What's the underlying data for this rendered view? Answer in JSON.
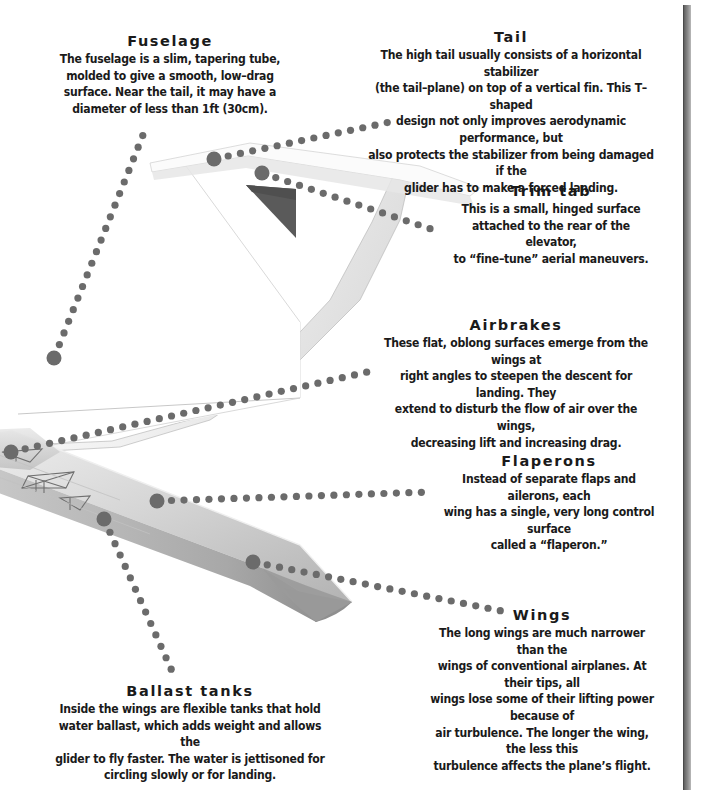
{
  "page": {
    "width": 703,
    "height": 790,
    "background": "#ffffff",
    "ink": "#1a1a1a",
    "leader_dot_color": "#6b6b6b",
    "gutter_color": "#6f6f6f"
  },
  "illustration": {
    "name": "cutaway-glider-sailplane",
    "fuselage_color": "#f4f4f4",
    "wing_color": "#cfcfcf",
    "wingtip_color": "#8f8f8f",
    "fin_shadow_color": "#5a5a5a",
    "outline_color": "#9a9a9a"
  },
  "callouts": [
    {
      "id": "fuselage",
      "title": "Fuselage",
      "body": "The fuselage is a slim, tapering tube,\nmolded to give a smooth, low–drag\nsurface. Near the tail, it may have a\ndiameter of less than 1ft (30cm).",
      "x": 48,
      "y": 32,
      "width": 244
    },
    {
      "id": "tail",
      "title": "Tail",
      "body": "The high tail usually consists of a horizontal stabilizer\n(the tail–plane) on top of a vertical fin. This T–shaped\ndesign not only improves aerodynamic performance, but\nalso protects the stabilizer from being damaged if the\nglider has to make a forced landing.",
      "x": 355,
      "y": 28,
      "width": 312
    },
    {
      "id": "trim-tab",
      "title": "Trim tab",
      "body": "This is a small, hinged surface\nattached to the rear of the elevator,\nto “fine–tune” aerial maneuvers.",
      "x": 437,
      "y": 182,
      "width": 228
    },
    {
      "id": "airbrakes",
      "title": "Airbrakes",
      "body": "These flat, oblong surfaces emerge from the wings at\nright angles to steepen the descent for landing. They\nextend to disturb the flow of air over the wings,\ndecreasing lift and increasing drag.",
      "x": 366,
      "y": 316,
      "width": 300
    },
    {
      "id": "flaperons",
      "title": "Flaperons",
      "body": "Instead of separate flaps and ailerons, each\nwing has a single, very long control surface\ncalled a “flaperon.”",
      "x": 432,
      "y": 452,
      "width": 234
    },
    {
      "id": "wings",
      "title": "Wings",
      "body": "The long wings are much narrower than the\nwings of conventional airplanes. At their tips, all\nwings lose some of their lifting power because of\nair turbulence. The longer the wing, the less this\nturbulence affects the plane’s flight.",
      "x": 418,
      "y": 606,
      "width": 248
    },
    {
      "id": "ballast-tanks",
      "title": "Ballast tanks",
      "body": "Inside the wings are flexible tanks that hold\nwater ballast, which adds weight and allows the\nglider to fly faster. The water is jettisoned for\ncircling slowly or for landing.",
      "x": 42,
      "y": 682,
      "width": 296
    }
  ],
  "leaders": [
    {
      "id": "leader-fuselage",
      "anchor": {
        "x": 54,
        "y": 358,
        "r": 7.5
      },
      "path": [
        [
          54,
          358
        ],
        [
          145,
          130
        ]
      ],
      "dot_r": 3.6,
      "spacing": 12.5
    },
    {
      "id": "leader-tail",
      "anchor": {
        "x": 214,
        "y": 159,
        "r": 7.5
      },
      "path": [
        [
          214,
          159
        ],
        [
          390,
          122
        ]
      ],
      "dot_r": 3.6,
      "spacing": 12.5
    },
    {
      "id": "leader-trim-tab",
      "anchor": {
        "x": 262,
        "y": 173,
        "r": 7.5
      },
      "path": [
        [
          262,
          173
        ],
        [
          434,
          230
        ]
      ],
      "dot_r": 3.6,
      "spacing": 12.5
    },
    {
      "id": "leader-airbrakes",
      "anchor": {
        "x": 11,
        "y": 452,
        "r": 7.5
      },
      "path": [
        [
          11,
          452
        ],
        [
          372,
          371
        ]
      ],
      "dot_r": 3.6,
      "spacing": 12.5
    },
    {
      "id": "leader-flaperons",
      "anchor": {
        "x": 157,
        "y": 501,
        "r": 7.5
      },
      "path": [
        [
          157,
          501
        ],
        [
          430,
          492
        ]
      ],
      "dot_r": 3.6,
      "spacing": 12.5
    },
    {
      "id": "leader-wings",
      "anchor": {
        "x": 253,
        "y": 562,
        "r": 7.5
      },
      "path": [
        [
          253,
          562
        ],
        [
          507,
          612
        ]
      ],
      "dot_r": 3.6,
      "spacing": 12.5
    },
    {
      "id": "leader-ballast-tanks",
      "anchor": {
        "x": 104,
        "y": 519,
        "r": 7.5
      },
      "path": [
        [
          104,
          519
        ],
        [
          176,
          680
        ]
      ],
      "dot_r": 3.6,
      "spacing": 12.5
    }
  ]
}
